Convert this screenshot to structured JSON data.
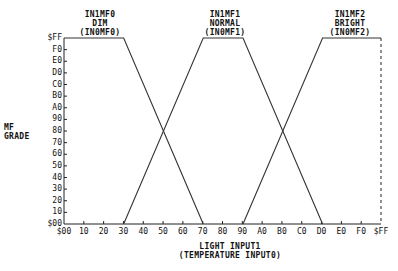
{
  "chart_data": {
    "type": "line",
    "title": "",
    "xlabel": "LIGHT INPUT1",
    "xlabel_sub": "(TEMPERATURE INPUT0)",
    "ylabel": "MF GRADE",
    "ylabel_lines": [
      "MF",
      "GRADE"
    ],
    "xlim": [
      0,
      255
    ],
    "ylim": [
      0,
      255
    ],
    "x_ticks": [
      "$00",
      "10",
      "20",
      "30",
      "40",
      "50",
      "60",
      "70",
      "80",
      "90",
      "A0",
      "B0",
      "C0",
      "D0",
      "E0",
      "F0",
      "$FF"
    ],
    "y_ticks": [
      "$00",
      "10",
      "20",
      "30",
      "40",
      "50",
      "60",
      "70",
      "80",
      "90",
      "A0",
      "B0",
      "C0",
      "D0",
      "E0",
      "F0",
      "$FF"
    ],
    "grid": false,
    "series": [
      {
        "name": "IN1MF0",
        "label_lines": [
          "IN1MF0",
          "DIM",
          "(IN0MF0)"
        ],
        "x": [
          0,
          48,
          112
        ],
        "y": [
          255,
          255,
          0
        ]
      },
      {
        "name": "IN1MF1",
        "label_lines": [
          "IN1MF1",
          "NORMAL",
          "(IN0MF1)"
        ],
        "x": [
          48,
          112,
          144,
          208
        ],
        "y": [
          0,
          255,
          255,
          0
        ]
      },
      {
        "name": "IN1MF2",
        "label_lines": [
          "IN1MF2",
          "BRIGHT",
          "(IN0MF2)"
        ],
        "x": [
          144,
          208,
          255
        ],
        "y": [
          0,
          255,
          255
        ]
      }
    ]
  }
}
